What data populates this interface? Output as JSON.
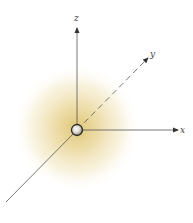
{
  "diagram": {
    "axes": {
      "x": {
        "label": "x"
      },
      "y": {
        "label": "y"
      },
      "z": {
        "label": "z"
      }
    },
    "colors": {
      "cloud_center": "#e2c873",
      "cloud_edge": "#ffffff",
      "axis_line": "#555555",
      "nucleus_fill": "#f4f2ee",
      "nucleus_stroke": "#2a2a2a"
    }
  }
}
